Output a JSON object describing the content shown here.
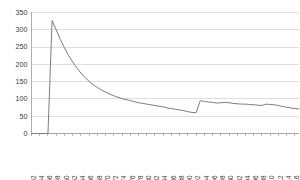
{
  "chart_data": {
    "type": "line",
    "title": "",
    "xlabel": "",
    "ylabel": "",
    "ylim": [
      0,
      350
    ],
    "xlim": [
      1952,
      2017
    ],
    "grid": true,
    "legend": null,
    "line_color": "#7c7c7c",
    "grid_color": "#c8c8c8",
    "axis_color": "#9a9a9a",
    "background": "#ffffff",
    "yticks": [
      0,
      50,
      100,
      150,
      200,
      250,
      300,
      350
    ],
    "ytick_labels": [
      "0",
      "50",
      "100",
      "150",
      "200",
      "250",
      "300",
      "350"
    ],
    "xticks": [
      1952,
      1954,
      1956,
      1958,
      1960,
      1962,
      1964,
      1966,
      1968,
      1970,
      1972,
      1974,
      1976,
      1978,
      1980,
      1982,
      1984,
      1986,
      1988,
      1990,
      1992,
      1994,
      1996,
      1998,
      2000,
      2002,
      2004,
      2006,
      2008,
      2010,
      2012,
      2014,
      2016
    ],
    "xtick_labels": [
      "1952",
      "1954",
      "1956",
      "1958",
      "1960",
      "1962",
      "1964",
      "1966",
      "1968",
      "1970",
      "1972",
      "1974",
      "1976",
      "1978",
      "1980",
      "1982",
      "1984",
      "1986",
      "1988",
      "1990",
      "1992",
      "1994",
      "1996",
      "1998",
      "2000",
      "2002",
      "2004",
      "2006",
      "2008",
      "2010",
      "2012",
      "2014",
      "2016"
    ],
    "x": [
      1952,
      1953,
      1954,
      1955,
      1956,
      1957,
      1958,
      1959,
      1960,
      1961,
      1962,
      1963,
      1964,
      1965,
      1966,
      1967,
      1968,
      1969,
      1970,
      1971,
      1972,
      1973,
      1974,
      1975,
      1976,
      1977,
      1978,
      1979,
      1980,
      1981,
      1982,
      1983,
      1984,
      1985,
      1986,
      1987,
      1988,
      1989,
      1990,
      1991,
      1992,
      1993,
      1994,
      1995,
      1996,
      1997,
      1998,
      1999,
      2000,
      2001,
      2002,
      2003,
      2004,
      2005,
      2006,
      2007,
      2008,
      2009,
      2010,
      2011,
      2012,
      2013,
      2014,
      2015,
      2016,
      2017
    ],
    "values": [
      0,
      0,
      0,
      0,
      0,
      327,
      300,
      272,
      248,
      226,
      207,
      190,
      175,
      162,
      151,
      141,
      133,
      126,
      120,
      114,
      109,
      105,
      101,
      98,
      95,
      92,
      89,
      87,
      85,
      83,
      81,
      79,
      77,
      74,
      72,
      70,
      68,
      66,
      63,
      61,
      60,
      95,
      93,
      91,
      90,
      88,
      89,
      90,
      89,
      87,
      86,
      85,
      85,
      84,
      83,
      82,
      81,
      85,
      84,
      83,
      81,
      78,
      76,
      74,
      72,
      71
    ],
    "series_name": "value",
    "annotations": []
  }
}
